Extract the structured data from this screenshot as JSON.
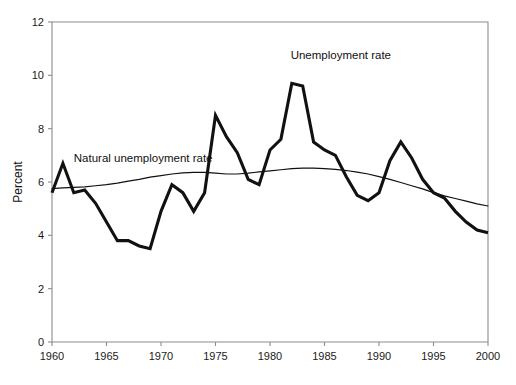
{
  "chart_data": {
    "type": "line",
    "title": "",
    "xlabel": "",
    "ylabel": "Percent",
    "xlim": [
      1960,
      2000
    ],
    "ylim": [
      0,
      12
    ],
    "grid": false,
    "legend_position": "inline-annotations",
    "x_ticks": [
      "1960",
      "1965",
      "1970",
      "1975",
      "1980",
      "1985",
      "1990",
      "1995",
      "2000"
    ],
    "y_ticks": [
      "0",
      "2",
      "4",
      "6",
      "8",
      "10",
      "12"
    ],
    "x": [
      1960,
      1961,
      1962,
      1963,
      1964,
      1965,
      1966,
      1967,
      1968,
      1969,
      1970,
      1971,
      1972,
      1973,
      1974,
      1975,
      1976,
      1977,
      1978,
      1979,
      1980,
      1981,
      1982,
      1983,
      1984,
      1985,
      1986,
      1987,
      1988,
      1989,
      1990,
      1991,
      1992,
      1993,
      1994,
      1995,
      1996,
      1997,
      1998,
      1999,
      2000
    ],
    "series": [
      {
        "name": "Unemployment rate",
        "style": "thick",
        "label_x": 1986.5,
        "label_y": 10.6,
        "values": [
          5.6,
          6.7,
          5.6,
          5.7,
          5.2,
          4.5,
          3.8,
          3.8,
          3.6,
          3.5,
          4.9,
          5.9,
          5.6,
          4.9,
          5.6,
          8.5,
          7.7,
          7.1,
          6.1,
          5.9,
          7.2,
          7.6,
          9.7,
          9.6,
          7.5,
          7.2,
          7.0,
          6.2,
          5.5,
          5.3,
          5.6,
          6.8,
          7.5,
          6.9,
          6.1,
          5.6,
          5.4,
          4.9,
          4.5,
          4.2,
          4.1
        ]
      },
      {
        "name": "Natural unemployment rate",
        "style": "thin",
        "label_x": 1962.0,
        "label_y": 6.75,
        "values": [
          5.75,
          5.78,
          5.8,
          5.82,
          5.86,
          5.9,
          5.96,
          6.03,
          6.1,
          6.18,
          6.24,
          6.3,
          6.34,
          6.36,
          6.36,
          6.33,
          6.3,
          6.3,
          6.33,
          6.38,
          6.42,
          6.46,
          6.5,
          6.52,
          6.52,
          6.5,
          6.47,
          6.43,
          6.37,
          6.3,
          6.2,
          6.1,
          5.98,
          5.86,
          5.74,
          5.6,
          5.48,
          5.38,
          5.28,
          5.18,
          5.1
        ]
      }
    ]
  },
  "axis": {
    "y_title": "Percent"
  }
}
